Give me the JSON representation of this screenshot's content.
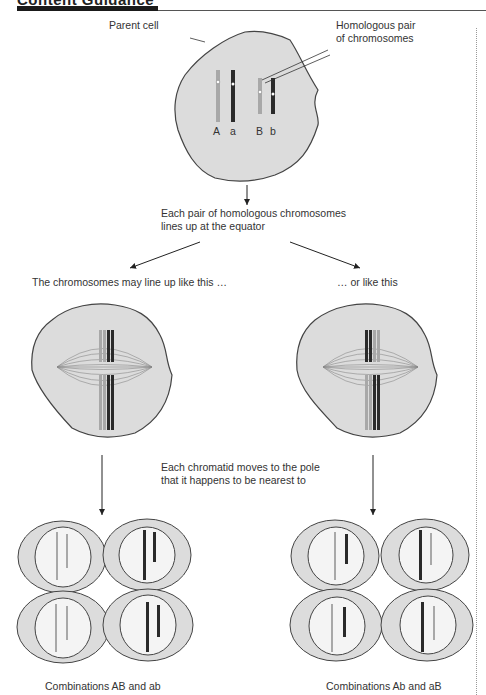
{
  "header": {
    "title": "Content Guidance"
  },
  "labels": {
    "parent_cell": "Parent cell",
    "homologous_line1": "Homologous pair",
    "homologous_line2": "of chromosomes",
    "allele_A": "A",
    "allele_a": "a",
    "allele_B": "B",
    "allele_b": "b",
    "lines_up_line1": "Each pair of homologous chromosomes",
    "lines_up_line2": "lines up at the equator",
    "option_left": "The chromosomes may line up like this …",
    "option_right": "… or like this",
    "chromatid_line1": "Each chromatid moves to the pole",
    "chromatid_line2": "that it happens to be nearest to",
    "result_left": "Combinations AB and ab",
    "result_right": "Combinations Ab and aB"
  },
  "colors": {
    "cell_fill": "#dcdcdc",
    "cell_stroke": "#444444",
    "light_chrom": "#a8a8a8",
    "dark_chrom": "#2a2a2a",
    "nucleus_fill": "#f4f4f4"
  }
}
